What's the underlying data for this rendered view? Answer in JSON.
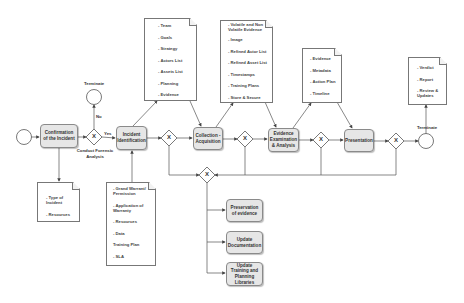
{
  "diagram": {
    "start_event": {
      "label": ""
    },
    "tasks": [
      {
        "id": "confirmation",
        "label": "Confirmation of the Incident"
      },
      {
        "id": "identification",
        "label": "Incident Identification"
      },
      {
        "id": "collection",
        "label": "Collection - Acquisition"
      },
      {
        "id": "examination",
        "label": "Evidence Examination & Analysis"
      },
      {
        "id": "presentation",
        "label": "Presentation"
      }
    ],
    "gateways": [
      {
        "id": "gw-forensic",
        "symbol": "X",
        "label": "Conduct Forensic Analysis"
      },
      {
        "id": "gw-2",
        "symbol": "X"
      },
      {
        "id": "gw-3",
        "symbol": "X"
      },
      {
        "id": "gw-4",
        "symbol": "X"
      },
      {
        "id": "gw-5",
        "symbol": "X"
      },
      {
        "id": "gw-merge",
        "symbol": "X"
      }
    ],
    "flow_labels": {
      "yes": "Yes",
      "no": "No"
    },
    "end_events": [
      {
        "id": "terminate-top",
        "label": "Terminate"
      },
      {
        "id": "terminate-right",
        "label": "Terminate"
      }
    ],
    "documents": {
      "incident_info": {
        "items": [
          "- Type of Incident",
          "- Resources"
        ]
      },
      "warrant": {
        "items": [
          "- Grand Warrant/ Permission",
          "- Application of Warranty",
          "- Resources",
          "- Data",
          "Training Plan",
          "- SLA"
        ]
      },
      "planning": {
        "items": [
          "- Team",
          "- Goals",
          "- Strategy",
          "- Actors List",
          "- Assets List",
          "- Planning",
          "- Evidence"
        ]
      },
      "collection": {
        "items": [
          "- Volatile and Non Volatile Evidence",
          "- Image",
          "- Refined Actor List",
          "- Refined Asset List",
          "- Timestamps",
          "- Training Plans",
          "- Store & Secure"
        ]
      },
      "analysis": {
        "items": [
          "- Evidence",
          "- Metadata",
          "- Action Plan",
          "- Timeline"
        ]
      },
      "outcome": {
        "items": [
          "- Verdict",
          "- Report",
          "- Review & Updates"
        ]
      }
    },
    "sub_tasks": [
      {
        "label": "Preservation of evidence"
      },
      {
        "label": "Update Documentation"
      },
      {
        "label": "Update Training and Planning Libraries"
      }
    ]
  }
}
